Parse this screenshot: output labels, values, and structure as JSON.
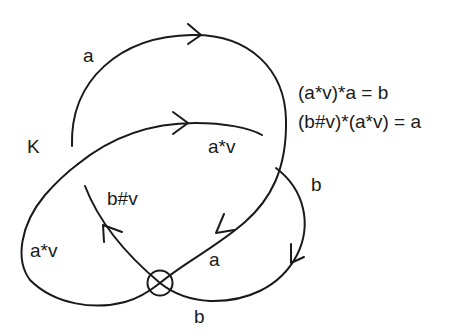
{
  "diagram": {
    "knot_label": "K",
    "arc_labels": {
      "top_arc": "a",
      "middle_arc": "a*v",
      "left_loop": "a*v",
      "inner_strand": "b#v",
      "right_upper": "b",
      "lower_right": "a",
      "bottom": "b"
    },
    "equations": [
      "(a*v)*a = b",
      "(b#v)*(a*v) = a"
    ],
    "virtual_crossing_symbol": "circle-cross",
    "colors": {
      "ink": "#1a1a1a",
      "background": "#ffffff"
    }
  }
}
